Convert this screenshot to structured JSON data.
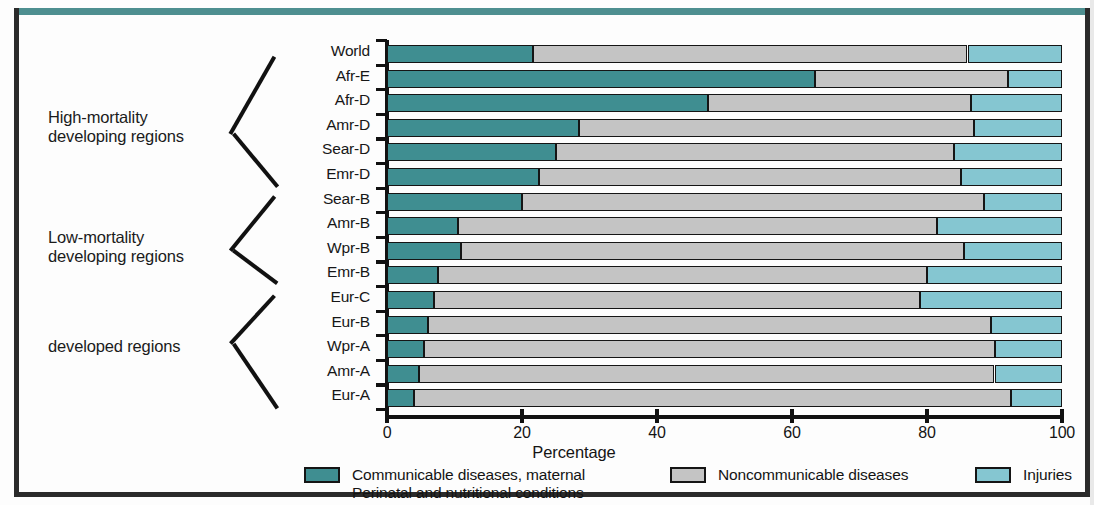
{
  "chart_data": {
    "type": "bar",
    "subtype": "stacked-horizontal-100",
    "title": "",
    "xlabel": "Percentage",
    "ylabel": "",
    "xlim": [
      0,
      100
    ],
    "xticks": [
      0,
      20,
      40,
      60,
      80,
      100
    ],
    "xtick_labels": [
      "0",
      "20",
      "40",
      "60",
      "80",
      "100"
    ],
    "grid": false,
    "legend_position": "bottom",
    "categories": [
      "World",
      "Afr-E",
      "Afr-D",
      "Amr-D",
      "Sear-D",
      "Emr-D",
      "Sear-B",
      "Amr-B",
      "Wpr-B",
      "Emr-B",
      "Eur-C",
      "Eur-B",
      "Wpr-A",
      "Amr-A",
      "Eur-A"
    ],
    "series": [
      {
        "name": "Communicable diseases, maternal\nPerinatal and nutritional conditions",
        "color": "#3f8e91",
        "values": [
          21.6,
          63.4,
          47.5,
          28.5,
          25.0,
          22.5,
          20.0,
          10.5,
          11.0,
          7.5,
          7.0,
          6.0,
          5.5,
          4.8,
          4.0
        ]
      },
      {
        "name": "Noncommunicable diseases",
        "color": "#c4c4c4",
        "values": [
          64.4,
          28.6,
          39.0,
          58.5,
          59.0,
          62.5,
          68.5,
          71.0,
          74.5,
          72.5,
          72.0,
          83.5,
          84.5,
          85.2,
          88.5
        ]
      },
      {
        "name": "Injuries",
        "color": "#85c6d1",
        "values": [
          14.0,
          8.0,
          13.5,
          13.0,
          16.0,
          15.0,
          11.5,
          18.5,
          14.5,
          20.0,
          21.0,
          10.5,
          10.0,
          10.0,
          7.5
        ]
      }
    ],
    "group_labels": [
      {
        "text": "High-mortality\ndeveloping regions",
        "rows": [
          "Afr-E",
          "Afr-D",
          "Amr-D",
          "Sear-D",
          "Emr-D"
        ]
      },
      {
        "text": "Low-mortality\ndeveloping regions",
        "rows": [
          "Sear-B",
          "Amr-B",
          "Wpr-B",
          "Emr-B"
        ]
      },
      {
        "text": "developed regions",
        "rows": [
          "Eur-C",
          "Eur-B",
          "Wpr-A",
          "Amr-A",
          "Eur-A"
        ]
      }
    ]
  },
  "legend": {
    "items": [
      {
        "label": "Communicable diseases, maternal\nPerinatal and nutritional conditions",
        "color": "#3f8e91"
      },
      {
        "label": "Noncommunicable diseases",
        "color": "#c4c4c4"
      },
      {
        "label": "Injuries",
        "color": "#85c6d1"
      }
    ]
  },
  "frame": {
    "top_border_color": "#4e8f90",
    "border_color": "#2b2b2b"
  }
}
